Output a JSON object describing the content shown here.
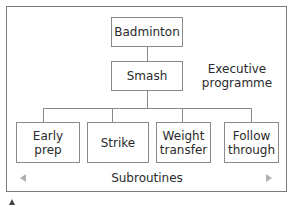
{
  "diagram": {
    "root": {
      "label": "Badminton"
    },
    "executive": {
      "label": "Smash",
      "annotation": "Executive programme"
    },
    "subroutines": {
      "caption": "Subroutines",
      "items": [
        {
          "label": "Early prep"
        },
        {
          "label": "Strike"
        },
        {
          "label": "Weight transfer"
        },
        {
          "label": "Follow through"
        }
      ]
    },
    "colors": {
      "border": "#8a8a8a",
      "frame": "#7a7a7a",
      "arrow": "#b0b0b0",
      "text": "#2a2a2a"
    }
  }
}
